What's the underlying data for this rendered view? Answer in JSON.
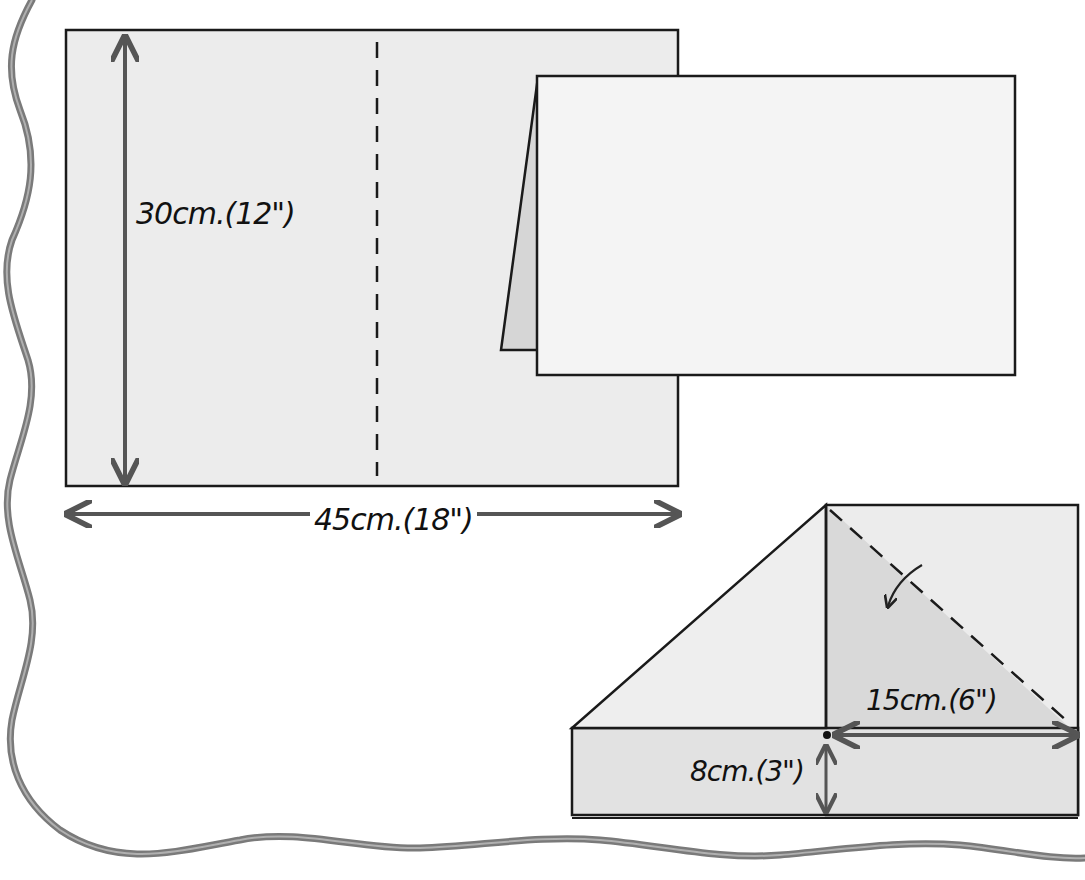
{
  "diagram": {
    "type": "paper-folding-instructions",
    "steps": [
      {
        "name": "flat-sheet",
        "dimensions": {
          "height_label": "30cm.(12\")",
          "width_label": "45cm.(18\")"
        },
        "fold_line": "vertical dashed center line"
      },
      {
        "name": "folded-in-half",
        "description": "sheet folded along center line"
      },
      {
        "name": "corner-fold",
        "dimensions": {
          "horizontal_label": "15cm.(6\")",
          "vertical_label": "8cm.(3\")"
        },
        "fold_line": "diagonal dashed line with curved fold arrow"
      }
    ],
    "colors": {
      "paper": "#ececec",
      "paper_shaded": "#d9d9d9",
      "outline": "#1a1a1a",
      "arrow": "#555555",
      "ribbon": "#7a7a7a"
    }
  }
}
